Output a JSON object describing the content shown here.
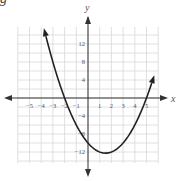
{
  "corner_label": "g",
  "chart_data": {
    "type": "line",
    "title": "",
    "xlabel": "x",
    "ylabel": "y",
    "function": "y = x^2 - 3x - 10",
    "x_ticks": [
      -5,
      -4,
      -3,
      -2,
      -1,
      1,
      2,
      3,
      4,
      5
    ],
    "x_tick_labels": [
      "−5",
      "−4",
      "−3",
      "−2",
      "−1",
      "1",
      "2",
      "3",
      "4",
      "5"
    ],
    "y_ticks": [
      12,
      8,
      4,
      -4,
      -8,
      -12
    ],
    "y_tick_labels": [
      "12",
      "8",
      "4",
      "−4",
      "−8",
      "−12"
    ],
    "xlim": [
      -6,
      6
    ],
    "ylim": [
      -14,
      16
    ],
    "grid": true,
    "grid_x_step": 1,
    "grid_y_step": 2,
    "series": [
      {
        "name": "parabola",
        "x": [
          -3.75,
          -3,
          -2,
          -1,
          0,
          1,
          1.5,
          2,
          3,
          4,
          5,
          5.5
        ],
        "values": [
          15.3125,
          8,
          0,
          -6,
          -10,
          -12,
          -12.25,
          -12,
          -10,
          -6,
          0,
          3.75
        ]
      }
    ],
    "key_points": {
      "x_intercepts": [
        -2,
        5
      ],
      "y_intercept": -10,
      "vertex": [
        1.5,
        -12.25
      ]
    },
    "colors": {
      "curve": "#222222",
      "axis": "#333333",
      "grid": "#d8d8d8",
      "text": "#555555"
    }
  }
}
